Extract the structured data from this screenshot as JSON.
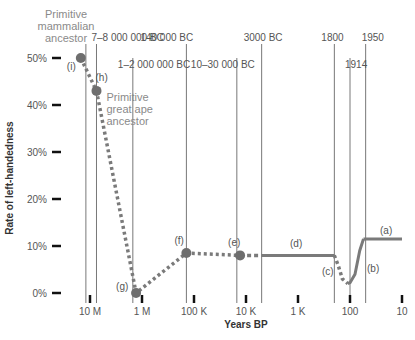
{
  "chart_data": {
    "type": "line",
    "title": "",
    "xlabel": "Years BP",
    "ylabel": "Rate of left-handedness",
    "x_scale": "log",
    "x_reversed": true,
    "y_ticks": [
      {
        "value": 50,
        "label": "50%"
      },
      {
        "value": 40,
        "label": "40%"
      },
      {
        "value": 30,
        "label": "30%"
      },
      {
        "value": 20,
        "label": "20%"
      },
      {
        "value": 10,
        "label": "10%"
      },
      {
        "value": 0,
        "label": "0%"
      }
    ],
    "x_ticks": [
      {
        "value": 10000000,
        "label": "10 M"
      },
      {
        "value": 1000000,
        "label": "1 M"
      },
      {
        "value": 100000,
        "label": "100 K"
      },
      {
        "value": 10000,
        "label": "10 K"
      },
      {
        "value": 1000,
        "label": "1 K"
      },
      {
        "value": 100,
        "label": "100"
      },
      {
        "value": 10,
        "label": "10"
      }
    ],
    "ylim": [
      0,
      50
    ],
    "xlim": [
      20000000,
      10
    ],
    "era_markers": [
      {
        "years_bp": 12000000,
        "label": "",
        "row": 0
      },
      {
        "years_bp": 7500000,
        "label": "7–8 000 000 BC",
        "row": 0
      },
      {
        "years_bp": 1500000,
        "label": "1–2 000 000 BC",
        "row": 1
      },
      {
        "years_bp": 140000,
        "label": "140 000 BC",
        "row": 0
      },
      {
        "years_bp": 15000,
        "label": "10–30 000 BC",
        "row": 1
      },
      {
        "years_bp": 5000,
        "label": "3000 BC",
        "row": 0
      },
      {
        "years_bp": 200,
        "label": "1800",
        "row": 0
      },
      {
        "years_bp": 100,
        "label": "1914",
        "row": 1
      },
      {
        "years_bp": 50,
        "label": "1950",
        "row": 0
      }
    ],
    "points": [
      {
        "id": "i",
        "label": "(i)",
        "years_bp": 15000000,
        "value": 50
      },
      {
        "id": "h",
        "label": "(h)",
        "years_bp": 7500000,
        "value": 43
      },
      {
        "id": "g",
        "label": "(g)",
        "years_bp": 1300000,
        "value": 0
      },
      {
        "id": "f",
        "label": "(f)",
        "years_bp": 140000,
        "value": 8.5
      },
      {
        "id": "e",
        "label": "(e)",
        "years_bp": 13000,
        "value": 8
      }
    ],
    "series": [
      {
        "name": "estimated (dotted)",
        "style": "dotted",
        "segment": "i-h-g-f-e",
        "points": [
          [
            15000000,
            50
          ],
          [
            7500000,
            43
          ],
          [
            1300000,
            0
          ],
          [
            140000,
            8.5
          ],
          [
            13000,
            8
          ]
        ]
      },
      {
        "name": "estimated (dashed)",
        "style": "dashed",
        "points": [
          [
            13000,
            8
          ],
          [
            5000,
            8
          ]
        ]
      },
      {
        "name": "(d) historical",
        "label": "(d)",
        "style": "solid",
        "points": [
          [
            5000,
            8
          ],
          [
            200,
            8
          ]
        ]
      },
      {
        "name": "(c) decline",
        "label": "(c)",
        "style": "dotted",
        "points": [
          [
            200,
            8
          ],
          [
            170,
            6
          ],
          [
            140,
            3
          ],
          [
            110,
            2
          ]
        ]
      },
      {
        "name": "(b) rise",
        "label": "(b)",
        "style": "solid",
        "points": [
          [
            110,
            2
          ],
          [
            100,
            2.2
          ],
          [
            80,
            4
          ],
          [
            65,
            9
          ],
          [
            55,
            11.5
          ]
        ]
      },
      {
        "name": "(a) modern",
        "label": "(a)",
        "style": "solid",
        "points": [
          [
            55,
            11.5
          ],
          [
            10,
            11.5
          ]
        ]
      }
    ],
    "annotations": [
      {
        "text": [
          "Primitive",
          "mammalian",
          "ancestor"
        ],
        "attached_to": "i"
      },
      {
        "text": [
          "Primitive",
          "great ape",
          "ancestor"
        ],
        "attached_to": "h"
      }
    ],
    "colors": {
      "line": "#7a7a7a",
      "point": "#6e6e6e",
      "annotation": "#8a8a8a",
      "grid": "#555555",
      "tick": "#111111"
    },
    "grid": false
  }
}
